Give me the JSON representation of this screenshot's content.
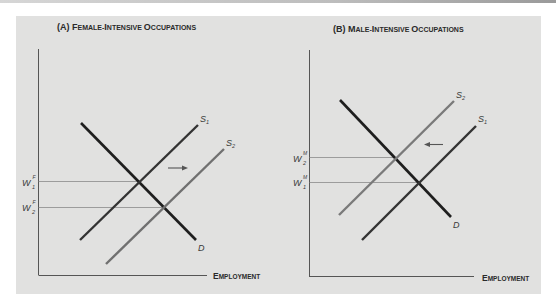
{
  "figure": {
    "panels": [
      {
        "id": "A",
        "title_prefix": "(A) F",
        "title": "(A) Female-Intensive Occupations",
        "title_small_caps": [
          "(A) F",
          "EMALE-",
          "I",
          "NTENSIVE ",
          "O",
          "CCUPATIONS"
        ],
        "x_axis_label": "Employment",
        "x_axis_label_parts": [
          "E",
          "MPLOYMENT"
        ],
        "curves": {
          "demand": "D",
          "supply_initial": "S",
          "supply_initial_sub": "1",
          "supply_new": "S",
          "supply_new_sub": "2"
        },
        "wage_labels": [
          {
            "base": "W",
            "sup": "F",
            "sub": "1"
          },
          {
            "base": "W",
            "sup": "F",
            "sub": "2"
          }
        ],
        "shift_direction": "right"
      },
      {
        "id": "B",
        "title": "(B) Male-Intensive Occupations",
        "title_small_caps": [
          "(B) M",
          "ALE-",
          "I",
          "NTENSIVE ",
          "O",
          "CCUPATIONS"
        ],
        "x_axis_label": "Employment",
        "x_axis_label_parts": [
          "E",
          "MPLOYMENT"
        ],
        "curves": {
          "demand": "D",
          "supply_initial": "S",
          "supply_initial_sub": "1",
          "supply_new": "S",
          "supply_new_sub": "2"
        },
        "wage_labels": [
          {
            "base": "W",
            "sup": "M",
            "sub": "2"
          },
          {
            "base": "W",
            "sup": "M",
            "sub": "1"
          }
        ],
        "shift_direction": "left"
      }
    ],
    "colors": {
      "background": "#e1e1e0",
      "demand_line": "#1e1e1e",
      "supply_initial_line": "#3a3a3a",
      "supply_new_line": "#7a7a7a",
      "guide_line": "#8a8a8a",
      "axis": "#555555"
    }
  }
}
